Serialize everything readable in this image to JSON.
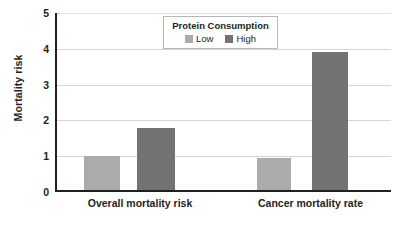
{
  "chart_data": {
    "type": "bar",
    "title": "",
    "xlabel": "",
    "ylabel": "Mortality risk",
    "ylim": [
      0,
      5
    ],
    "yticks": [
      "0",
      "1",
      "2",
      "3",
      "4",
      "5"
    ],
    "grid": true,
    "categories": [
      "Overall mortality risk",
      "Cancer mortality rate"
    ],
    "legend": {
      "title": "Protein Consumption",
      "position": "top-center",
      "entries": [
        {
          "name": "Low",
          "color": "#ababab"
        },
        {
          "name": "High",
          "color": "#737373"
        }
      ]
    },
    "series": [
      {
        "name": "Low",
        "color": "#ababab",
        "values": [
          1.0,
          0.95
        ]
      },
      {
        "name": "High",
        "color": "#737373",
        "values": [
          1.8,
          3.9
        ]
      }
    ]
  }
}
